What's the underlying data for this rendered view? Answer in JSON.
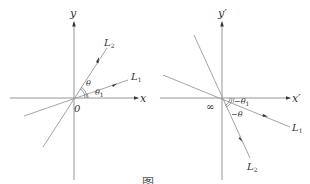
{
  "left_diagram": {
    "x_axis_label": "x",
    "y_axis_label": "y",
    "origin_label": "0",
    "line1_label": "L",
    "line1_sub": "1",
    "line2_label": "L",
    "line2_sub": "2",
    "angle_theta": "θ",
    "angle_theta1": "θ",
    "angle_theta1_sub": "1"
  },
  "right_diagram": {
    "x_axis_label": "x′",
    "y_axis_label": "y′",
    "origin_label": "∞",
    "line1_label": "L",
    "line1_sub": "1",
    "line2_label": "L",
    "line2_sub": "2",
    "angle_neg_theta": "−θ",
    "angle_neg_theta1": "−θ",
    "angle_neg_theta1_sub": "1"
  },
  "caption": "图"
}
